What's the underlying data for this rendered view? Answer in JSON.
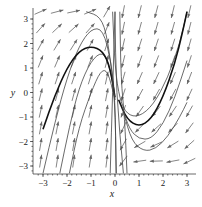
{
  "chart_data": {
    "type": "vector-field",
    "title": "",
    "xlabel": "x",
    "ylabel": "y",
    "xlim": [
      -3.3,
      3.3
    ],
    "ylim": [
      -3.3,
      3.3
    ],
    "x_ticks": [
      "-3",
      "-2",
      "-1",
      "0",
      "1",
      "2",
      "3"
    ],
    "y_ticks": [
      "3",
      "2",
      "1",
      "0",
      "-1",
      "-2",
      "-3"
    ],
    "grid": false,
    "legend": null,
    "arrow_grid": {
      "cols": 10,
      "rows": 10
    },
    "field_description": "Direction field: arrows point up-right (steep) for x<0, down-left for x>0; solution curves rise then plunge near x=0 on the left, and descend into U-shaped curves on the right.",
    "solution_curves": [
      {
        "name": "left-1",
        "bold": false,
        "points": [
          [
            -3.0,
            -3.3
          ],
          [
            -2.5,
            -1.2
          ],
          [
            -2.0,
            0.6
          ],
          [
            -1.5,
            1.9
          ],
          [
            -1.0,
            2.6
          ],
          [
            -0.5,
            2.6
          ],
          [
            -0.15,
            1.2
          ],
          [
            0.0,
            -0.2
          ],
          [
            0.05,
            -3.3
          ]
        ]
      },
      {
        "name": "left-2",
        "bold": false,
        "points": [
          [
            -2.3,
            -3.3
          ],
          [
            -1.9,
            -1.4
          ],
          [
            -1.5,
            0.2
          ],
          [
            -1.0,
            1.3
          ],
          [
            -0.5,
            1.7
          ],
          [
            -0.2,
            1.0
          ],
          [
            0.0,
            -0.3
          ],
          [
            0.05,
            -3.3
          ]
        ]
      },
      {
        "name": "left-3",
        "bold": true,
        "points": [
          [
            -3.0,
            -1.5
          ],
          [
            -2.5,
            -0.1
          ],
          [
            -2.0,
            1.0
          ],
          [
            -1.5,
            1.7
          ],
          [
            -1.0,
            1.9
          ],
          [
            -0.5,
            1.7
          ],
          [
            -0.2,
            1.0
          ],
          [
            0.0,
            -0.2
          ]
        ]
      },
      {
        "name": "left-4",
        "bold": false,
        "points": [
          [
            -1.9,
            -3.3
          ],
          [
            -1.5,
            -1.4
          ],
          [
            -1.0,
            0.0
          ],
          [
            -0.6,
            0.9
          ],
          [
            -0.3,
            0.9
          ],
          [
            0.0,
            -0.3
          ]
        ]
      },
      {
        "name": "left-5",
        "bold": false,
        "points": [
          [
            -1.2,
            3.3
          ],
          [
            -0.6,
            3.1
          ],
          [
            -0.3,
            2.2
          ],
          [
            0.0,
            -0.3
          ]
        ]
      },
      {
        "name": "right-1",
        "bold": false,
        "points": [
          [
            -0.1,
            3.3
          ],
          [
            0.0,
            1.0
          ],
          [
            0.2,
            -0.3
          ],
          [
            0.5,
            -0.9
          ],
          [
            1.0,
            -1.0
          ],
          [
            1.6,
            -0.5
          ],
          [
            2.2,
            0.6
          ],
          [
            2.7,
            2.0
          ],
          [
            3.0,
            3.3
          ]
        ]
      },
      {
        "name": "right-2",
        "bold": true,
        "points": [
          [
            0.15,
            -0.3
          ],
          [
            0.5,
            -1.1
          ],
          [
            1.0,
            -1.4
          ],
          [
            1.5,
            -1.1
          ],
          [
            2.0,
            -0.2
          ],
          [
            2.5,
            1.2
          ],
          [
            2.8,
            2.4
          ],
          [
            3.0,
            3.3
          ]
        ]
      },
      {
        "name": "right-3",
        "bold": false,
        "points": [
          [
            0.3,
            -0.6
          ],
          [
            0.6,
            -1.5
          ],
          [
            1.0,
            -1.9
          ],
          [
            1.5,
            -1.9
          ],
          [
            2.0,
            -1.3
          ],
          [
            2.5,
            -0.2
          ],
          [
            3.0,
            1.3
          ]
        ]
      },
      {
        "name": "right-4",
        "bold": false,
        "points": [
          [
            0.35,
            -0.8
          ],
          [
            0.7,
            -2.0
          ],
          [
            1.2,
            -2.4
          ],
          [
            1.7,
            -2.3
          ],
          [
            2.2,
            -1.8
          ],
          [
            2.7,
            -1.0
          ],
          [
            3.0,
            -0.4
          ]
        ]
      },
      {
        "name": "right-5",
        "bold": false,
        "points": [
          [
            0.2,
            3.3
          ],
          [
            0.25,
            0.5
          ],
          [
            0.4,
            -1.0
          ],
          [
            0.5,
            -3.3
          ]
        ]
      },
      {
        "name": "center-1",
        "bold": false,
        "points": [
          [
            0.0,
            3.3
          ],
          [
            0.05,
            0.0
          ],
          [
            0.35,
            -3.3
          ]
        ]
      },
      {
        "name": "center-2",
        "bold": false,
        "points": [
          [
            -0.2,
            -3.3
          ],
          [
            -0.1,
            0.0
          ],
          [
            0.0,
            3.3
          ]
        ]
      }
    ]
  },
  "axes": {
    "x_label": "x",
    "y_label": "y"
  }
}
